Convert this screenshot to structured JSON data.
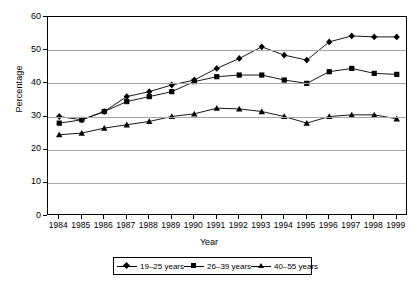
{
  "chart_data": {
    "type": "line",
    "title": "",
    "xlabel": "Year",
    "ylabel": "Percentage",
    "ylim": [
      0,
      60
    ],
    "ytick_step": 10,
    "yticks": [
      0,
      10,
      20,
      30,
      40,
      50,
      60
    ],
    "grid": "horizontal",
    "legend_position": "bottom",
    "categories": [
      "1984",
      "1985",
      "1986",
      "1987",
      "1988",
      "1989",
      "1990",
      "1991",
      "1992",
      "1993",
      "1994",
      "1995",
      "1996",
      "1997",
      "1998",
      "1999"
    ],
    "series": [
      {
        "name": "19–25 years",
        "marker": "diamond",
        "values": [
          30,
          29,
          31.5,
          36,
          37.5,
          39.5,
          41,
          44.5,
          47.5,
          51,
          48.5,
          47,
          52.5,
          54.3,
          54,
          54
        ]
      },
      {
        "name": "26–39 years",
        "marker": "square",
        "values": [
          28,
          29,
          31.5,
          34.5,
          36,
          37.5,
          40.5,
          42,
          42.5,
          42.5,
          41,
          40,
          43.5,
          44.5,
          43,
          42.7
        ]
      },
      {
        "name": "40–55 years",
        "marker": "triangle",
        "values": [
          24.5,
          25,
          26.5,
          27.5,
          28.5,
          30,
          30.8,
          32.5,
          32.3,
          31.5,
          30,
          28,
          30,
          30.5,
          30.5,
          29.3
        ]
      }
    ],
    "colors": {
      "line": "#000000",
      "marker": "#000000",
      "grid": "#a6a6a6",
      "axis": "#000000",
      "background": "#ffffff"
    }
  }
}
